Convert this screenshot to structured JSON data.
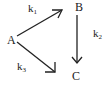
{
  "diagram": {
    "type": "reaction-scheme",
    "nodes": [
      {
        "id": "A",
        "label": "A"
      },
      {
        "id": "B",
        "label": "B"
      },
      {
        "id": "C",
        "label": "C"
      }
    ],
    "edges": [
      {
        "from": "A",
        "to": "B",
        "label": "k",
        "subscript": "1"
      },
      {
        "from": "B",
        "to": "C",
        "label": "k",
        "subscript": "2"
      },
      {
        "from": "A",
        "to": "C",
        "label": "k",
        "subscript": "3"
      }
    ],
    "colors": {
      "ink": "#222222",
      "background": "#ffffff"
    }
  }
}
